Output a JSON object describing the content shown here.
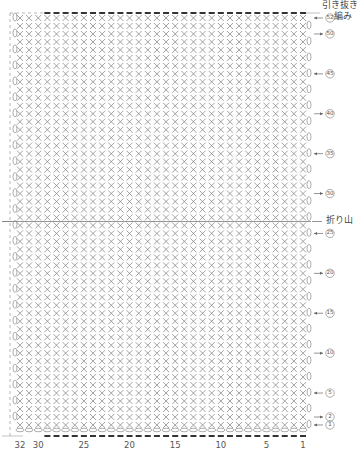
{
  "chart_data": {
    "type": "crochet-chart",
    "title": "",
    "stitch": "single crochet (×)",
    "columns": 32,
    "rows": 52,
    "column_labels": [
      32,
      30,
      25,
      20,
      15,
      10,
      5,
      1
    ],
    "row_labels": [
      52,
      50,
      45,
      40,
      35,
      30,
      25,
      20,
      15,
      10,
      5,
      2,
      1
    ],
    "row_label_side": "right",
    "fold_between_rows": [
      26,
      27
    ],
    "annotations": {
      "top": "引き抜き編み",
      "fold": "折り山"
    },
    "grid": false,
    "legend": null
  },
  "annotations": {
    "slip_stitch_line1": "引き抜き",
    "slip_stitch_line2": "編み",
    "fold_label": "折り山"
  },
  "bottom_scale": [
    {
      "label": "32",
      "col": 32
    },
    {
      "label": "30",
      "col": 30
    },
    {
      "label": "25",
      "col": 25
    },
    {
      "label": "20",
      "col": 20
    },
    {
      "label": "15",
      "col": 15
    },
    {
      "label": "10",
      "col": 10
    },
    {
      "label": "5",
      "col": 5
    },
    {
      "label": "1",
      "col": 1
    }
  ],
  "row_markers": [
    {
      "label": "52",
      "row": 52,
      "dir": "in"
    },
    {
      "label": "50",
      "row": 50,
      "dir": "out"
    },
    {
      "label": "45",
      "row": 45,
      "dir": "in"
    },
    {
      "label": "40",
      "row": 40,
      "dir": "out"
    },
    {
      "label": "35",
      "row": 35,
      "dir": "in"
    },
    {
      "label": "30",
      "row": 30,
      "dir": "out"
    },
    {
      "label": "25",
      "row": 25,
      "dir": "in"
    },
    {
      "label": "20",
      "row": 20,
      "dir": "out"
    },
    {
      "label": "15",
      "row": 15,
      "dir": "in"
    },
    {
      "label": "10",
      "row": 10,
      "dir": "out"
    },
    {
      "label": "5",
      "row": 5,
      "dir": "in"
    },
    {
      "label": "2",
      "row": 2,
      "dir": "out"
    },
    {
      "label": "1",
      "row": 1,
      "dir": "in"
    }
  ],
  "colors": {
    "stitch": "#8a8a8a",
    "chain": "#333333",
    "text": "#444444",
    "guide": "#999999"
  }
}
